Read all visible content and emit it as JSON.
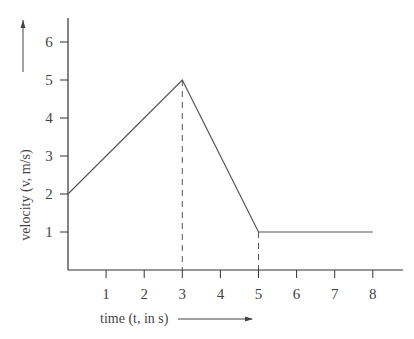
{
  "chart_data": {
    "type": "line",
    "title": "",
    "xlabel": "time (t, in s)",
    "ylabel": "velocity (v, m/s)",
    "x_ticks": [
      1,
      2,
      3,
      4,
      5,
      6,
      7,
      8
    ],
    "y_ticks": [
      1,
      2,
      3,
      4,
      5,
      6
    ],
    "xlim": [
      0,
      8.8
    ],
    "ylim": [
      0,
      6.5
    ],
    "grid": false,
    "legend": null,
    "series": [
      {
        "name": "velocity",
        "x": [
          0,
          3,
          5,
          8
        ],
        "y": [
          2,
          5,
          1,
          1
        ]
      }
    ],
    "annotations": [
      {
        "type": "dashed-vertical",
        "x": 3,
        "from_y": 0,
        "to_y": 5
      },
      {
        "type": "dashed-vertical",
        "x": 5,
        "from_y": 0,
        "to_y": 1
      },
      {
        "type": "arrow",
        "direction": "up",
        "near": "ylabel"
      },
      {
        "type": "arrow",
        "direction": "right",
        "near": "xlabel"
      }
    ],
    "colors": {
      "line": "#555555",
      "axis": "#333333"
    }
  }
}
